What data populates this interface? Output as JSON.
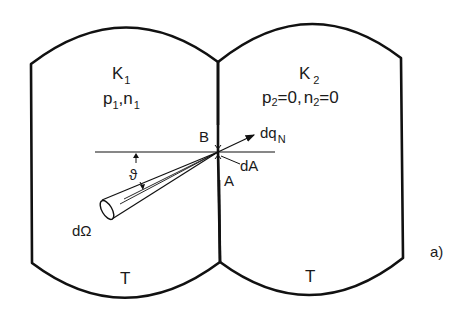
{
  "diagram": {
    "panel_label": "a)",
    "left_chamber": {
      "name": "K",
      "name_sub": "1",
      "state_p": "p",
      "state_p_sub": "1",
      "state_sep": ",",
      "state_n": "n",
      "state_n_sub": "1",
      "temperature": "T"
    },
    "right_chamber": {
      "name": "K",
      "name_sub": "2",
      "state_p": "p",
      "state_p_sub": "2",
      "state_p_val": "=0,",
      "state_n": "n",
      "state_n_sub": "2",
      "state_n_val": "=0",
      "temperature": "T"
    },
    "labels": {
      "point_b": "B",
      "point_a": "A",
      "area_element": "dA",
      "flux": "dq",
      "flux_sub": "N",
      "angle": "ϑ",
      "solid_angle": "dΩ"
    },
    "colors": {
      "stroke": "#111111",
      "background": "#ffffff"
    }
  }
}
